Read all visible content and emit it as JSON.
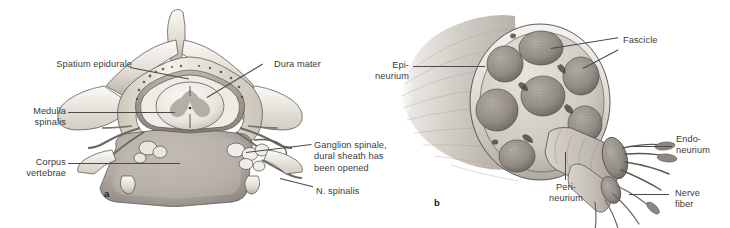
{
  "figure": {
    "background_color": "#ffffff",
    "text_color": "#3a3a3a",
    "leader_color": "#4a4a4a"
  },
  "panels": [
    {
      "letter": "a",
      "caption": "Transverse section through a vertebra with spinal cord and spinal nerve",
      "labels": [
        {
          "id": "spatium-epidurale",
          "text": "Spatium epidurale",
          "align": "right"
        },
        {
          "id": "medulla-spinalis",
          "text": "Medulla\nspinalis",
          "align": "right"
        },
        {
          "id": "corpus-vertebrae",
          "text": "Corpus\nvertebrae",
          "align": "right"
        },
        {
          "id": "dura-mater",
          "text": "Dura mater",
          "align": "left"
        },
        {
          "id": "ganglion-spinale",
          "text": "Ganglion spinale,\ndural sheath has\nbeen opened",
          "align": "left"
        },
        {
          "id": "n-spinalis",
          "text": "N. spinalis",
          "align": "left"
        }
      ]
    },
    {
      "letter": "b",
      "caption": "Peripheral nerve, cross-section showing connective tissue sheaths",
      "labels": [
        {
          "id": "epineurium",
          "text": "Epi-\nneurium",
          "align": "right"
        },
        {
          "id": "fascicle",
          "text": "Fascicle",
          "align": "left"
        },
        {
          "id": "endoneurium",
          "text": "Endo-\nneurium",
          "align": "left"
        },
        {
          "id": "nerve-fiber",
          "text": "Nerve\nfiber",
          "align": "left"
        },
        {
          "id": "perineurium",
          "text": "Peri-\nneurium",
          "align": "center"
        }
      ]
    }
  ],
  "colors": {
    "bone_light": "#f2efe9",
    "bone_mid": "#d9d3c8",
    "bone_shadow": "#a9a29a",
    "cord_light": "#efece7",
    "cord_gray": "#b9b5b0",
    "disc_gray": "#b0aaa4",
    "nerve_sheath": "#cfcac3",
    "fascicle_fill": "#9a948d",
    "outline": "#4d4a46"
  }
}
